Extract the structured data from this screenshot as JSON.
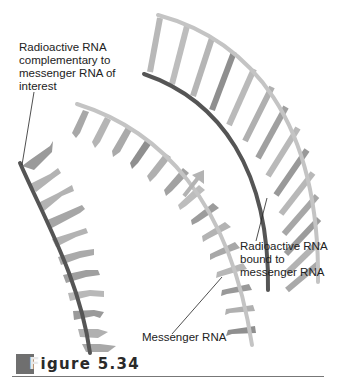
{
  "labels": {
    "radioactive_complementary": "Radioactive RNA\ncomplementary to\nmessenger RNA of\ninterest",
    "radioactive_bound": "Radioactive RNA\nbound to\nmessenger RNA",
    "messenger": "Messenger RNA"
  },
  "figure": {
    "first_letter": "F",
    "rest": "igure 5.34"
  },
  "icons": {
    "direction_arrow": "arrow-up-right-icon"
  },
  "colors": {
    "radioactive_strand": "#555555",
    "messenger_strand": "#c4c4c4",
    "base_light": "#b9b9b9",
    "base_mid": "#9d9d9d",
    "base_dark": "#7f7f7f",
    "caption_box": "#6f6f6f",
    "caption_rule": "#777777"
  }
}
